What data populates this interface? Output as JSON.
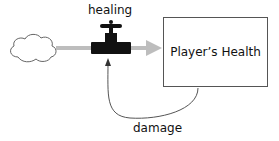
{
  "diagram": {
    "type": "stock-and-flow",
    "source": {
      "shape": "cloud",
      "label": ""
    },
    "flow": {
      "label": "healing",
      "icon": "valve-icon"
    },
    "stock": {
      "label": "Player’s Health"
    },
    "feedback": {
      "label": "damage"
    },
    "colors": {
      "flow_pipe": "#bdbdbd",
      "valve": "#111111",
      "stroke": "#555555"
    }
  }
}
